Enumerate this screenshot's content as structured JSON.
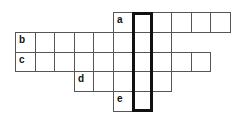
{
  "puzzle": {
    "type": "crossword",
    "grid_origin": {
      "x": 15,
      "y": 12
    },
    "cell_width": 19.5,
    "cell_height": 19.8,
    "rows": [
      {
        "label": "a",
        "row": 0,
        "start_col": 5,
        "end_col": 10
      },
      {
        "label": "b",
        "row": 1,
        "start_col": 0,
        "end_col": 7
      },
      {
        "label": "c",
        "row": 2,
        "start_col": 0,
        "end_col": 9
      },
      {
        "label": "d",
        "row": 3,
        "start_col": 3,
        "end_col": 7
      },
      {
        "label": "e",
        "row": 4,
        "start_col": 5,
        "end_col": 6
      }
    ],
    "highlighted_column": {
      "col": 6,
      "start_row": 0,
      "end_row": 4
    },
    "colors": {
      "line": "#555555",
      "highlight_border": "#111111",
      "background": "#ffffff"
    }
  }
}
